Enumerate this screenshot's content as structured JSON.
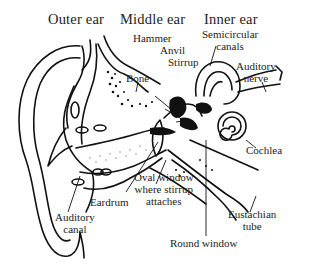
{
  "diagram": {
    "section_headers": {
      "outer": "Outer ear",
      "middle": "Middle ear",
      "inner": "Inner ear"
    },
    "labels": {
      "hammer": "Hammer",
      "anvil": "Anvil",
      "stirrup": "Stirrup",
      "semicircular_1": "Semicircular",
      "semicircular_2": "canals",
      "auditory_nerve_1": "Auditory",
      "auditory_nerve_2": "nerve",
      "bone": "Bone",
      "cochlea": "Cochlea",
      "oval_window_1": "Oval window",
      "oval_window_2": "where stirrup",
      "oval_window_3": "attaches",
      "eardrum": "Eardrum",
      "auditory_canal_1": "Auditory",
      "auditory_canal_2": "canal",
      "eustachian_1": "Eustachian",
      "eustachian_2": "tube",
      "round_window": "Round window"
    },
    "colors": {
      "ink": "#111111",
      "background": "#ffffff"
    }
  }
}
